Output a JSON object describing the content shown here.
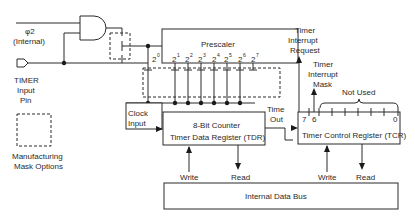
{
  "diagram": {
    "inputs": {
      "phi2_label": "φ2",
      "phi2_sub": "(Internal)",
      "timer_label": "TIMER",
      "timer_label2": "Input",
      "timer_label3": "Pin"
    },
    "legend": {
      "line1": "Manufacturing",
      "line2": "Mask Options"
    },
    "prescaler": {
      "title": "Prescaler",
      "taps": [
        "2",
        "2",
        "2",
        "2",
        "2",
        "2",
        "2",
        "2"
      ],
      "exponents": [
        "0",
        "1",
        "2",
        "3",
        "4",
        "5",
        "6",
        "7"
      ]
    },
    "counter": {
      "line1": "8-Bit Counter",
      "line2": "Timer Data Register (TDR)",
      "clock_line1": "Clock",
      "clock_line2": "Input",
      "write": "Write",
      "read": "Read"
    },
    "timeout": {
      "line1": "Time",
      "line2": "Out"
    },
    "tcr": {
      "title": "Timer Control Register (TCR)",
      "bit7": "7",
      "bit6": "6",
      "bit0": "0",
      "write": "Write",
      "read": "Read",
      "not_used": "Not Used",
      "tir_1": "Timer",
      "tir_2": "Interrupt",
      "tir_3": "Request",
      "tim_1": "Timer",
      "tim_2": "Interrupt",
      "tim_3": "Mask"
    },
    "bus": {
      "label": "Internal Data Bus"
    }
  }
}
